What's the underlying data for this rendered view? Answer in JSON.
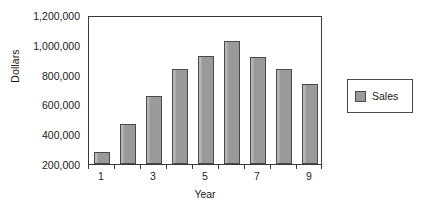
{
  "chart_data": {
    "type": "bar",
    "title": "",
    "xlabel": "Year",
    "ylabel": "Dollars",
    "categories": [
      "1",
      "2",
      "3",
      "4",
      "5",
      "6",
      "7",
      "8",
      "9"
    ],
    "values": [
      280000,
      470000,
      655000,
      835000,
      925000,
      1025000,
      920000,
      840000,
      740000
    ],
    "series": [
      {
        "name": "Sales",
        "values": [
          280000,
          470000,
          655000,
          835000,
          925000,
          1025000,
          920000,
          840000,
          740000
        ]
      }
    ],
    "ylim": [
      200000,
      1200000
    ],
    "ytick_values": [
      200000,
      400000,
      600000,
      800000,
      1000000,
      1200000
    ],
    "ytick_labels": [
      "200,000",
      "400,000",
      "600,000",
      "800,000",
      "1,000,000",
      "1,200,000"
    ],
    "xtick_labels": [
      "1",
      "3",
      "5",
      "7",
      "9"
    ],
    "xtick_visible_indices": [
      0,
      2,
      4,
      6,
      8
    ],
    "grid": false,
    "legend_position": "right",
    "legend_entries": [
      "Sales"
    ],
    "bar_color": "#9a9a9a",
    "bar_border_color": "#4a4a4a",
    "axis_color": "#3a3a3a",
    "background_color": "#ffffff"
  },
  "legend": {
    "sales_label": "Sales"
  }
}
